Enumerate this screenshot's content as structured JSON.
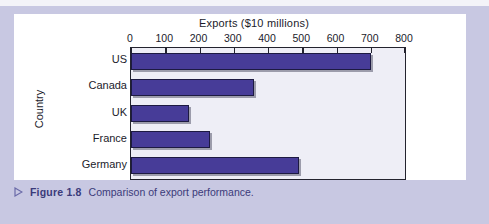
{
  "figure": {
    "caption_label": "Figure 1.8",
    "caption_text": "Comparison of export performance.",
    "bullet_icon": "triangle-right-icon"
  },
  "colors": {
    "bar": "#473c98",
    "bar_outline": "#1d1a42",
    "plot_background": "#eeeef6",
    "page_band": "#c8c8e2",
    "caption_text": "#3b3b7a",
    "axis": "#23232e"
  },
  "chart_data": {
    "type": "bar",
    "orientation": "horizontal",
    "title": "Exports ($10 millions)",
    "xlabel": "Exports ($10 millions)",
    "ylabel": "Country",
    "categories": [
      "US",
      "Canada",
      "UK",
      "France",
      "Germany"
    ],
    "values": [
      700,
      360,
      170,
      230,
      490
    ],
    "xlim": [
      0,
      800
    ],
    "xticks": [
      0,
      100,
      200,
      300,
      400,
      500,
      600,
      700,
      800
    ],
    "xtick_labels": [
      "0",
      "100",
      "200",
      "300",
      "400",
      "500",
      "600",
      "700",
      "800"
    ],
    "grid": false,
    "legend": null
  }
}
